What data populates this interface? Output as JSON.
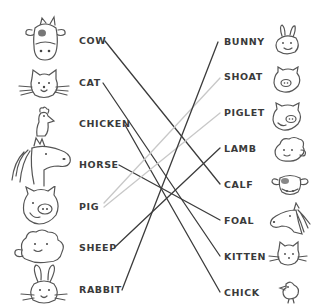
{
  "left_column": [
    {
      "label": "COW",
      "icon": "cow-icon",
      "x": 79,
      "y": 36
    },
    {
      "label": "CAT",
      "icon": "cat-icon",
      "x": 79,
      "y": 78
    },
    {
      "label": "CHICKEN",
      "icon": "chicken-icon",
      "x": 79,
      "y": 119
    },
    {
      "label": "HORSE",
      "icon": "horse-icon",
      "x": 79,
      "y": 160
    },
    {
      "label": "PIG",
      "icon": "pig-icon",
      "x": 79,
      "y": 202
    },
    {
      "label": "SHEEP",
      "icon": "sheep-icon",
      "x": 79,
      "y": 243
    },
    {
      "label": "RABBIT",
      "icon": "rabbit-icon",
      "x": 79,
      "y": 285
    }
  ],
  "right_column": [
    {
      "label": "BUNNY",
      "icon": "bunny-icon",
      "x": 224,
      "y": 37
    },
    {
      "label": "SHOAT",
      "icon": "shoat-icon",
      "x": 224,
      "y": 72
    },
    {
      "label": "PIGLET",
      "icon": "piglet-icon",
      "x": 224,
      "y": 108
    },
    {
      "label": "LAMB",
      "icon": "lamb-icon",
      "x": 224,
      "y": 144
    },
    {
      "label": "CALF",
      "icon": "calf-icon",
      "x": 224,
      "y": 180
    },
    {
      "label": "FOAL",
      "icon": "foal-icon",
      "x": 224,
      "y": 216
    },
    {
      "label": "KITTEN",
      "icon": "kitten-icon",
      "x": 224,
      "y": 252
    },
    {
      "label": "CHICK",
      "icon": "chick-icon",
      "x": 224,
      "y": 288
    }
  ],
  "connections": [
    {
      "from": "COW",
      "to": "CALF",
      "x1": 105,
      "y1": 41,
      "x2": 220,
      "y2": 184,
      "color": "#3c3c3c"
    },
    {
      "from": "CAT",
      "to": "KITTEN",
      "x1": 103,
      "y1": 83,
      "x2": 220,
      "y2": 256,
      "color": "#3c3c3c"
    },
    {
      "from": "CHICKEN",
      "to": "CHICK",
      "x1": 125,
      "y1": 125,
      "x2": 220,
      "y2": 292,
      "color": "#3c3c3c"
    },
    {
      "from": "HORSE",
      "to": "FOAL",
      "x1": 119,
      "y1": 165,
      "x2": 220,
      "y2": 220,
      "color": "#3c3c3c"
    },
    {
      "from": "PIG",
      "to": "SHOAT",
      "x1": 104,
      "y1": 203,
      "x2": 220,
      "y2": 78,
      "color": "#c8c8c8"
    },
    {
      "from": "PIG",
      "to": "PIGLET",
      "x1": 104,
      "y1": 207,
      "x2": 220,
      "y2": 113,
      "color": "#c8c8c8"
    },
    {
      "from": "SHEEP",
      "to": "LAMB",
      "x1": 115,
      "y1": 247,
      "x2": 220,
      "y2": 148,
      "color": "#3c3c3c"
    },
    {
      "from": "RABBIT",
      "to": "BUNNY",
      "x1": 122,
      "y1": 290,
      "x2": 218,
      "y2": 42,
      "color": "#3c3c3c"
    }
  ],
  "colors": {
    "text": "#3a3a3a",
    "line_dark": "#3c3c3c",
    "line_light": "#c8c8c8",
    "icon_stroke": "#555555",
    "background": "#ffffff"
  }
}
